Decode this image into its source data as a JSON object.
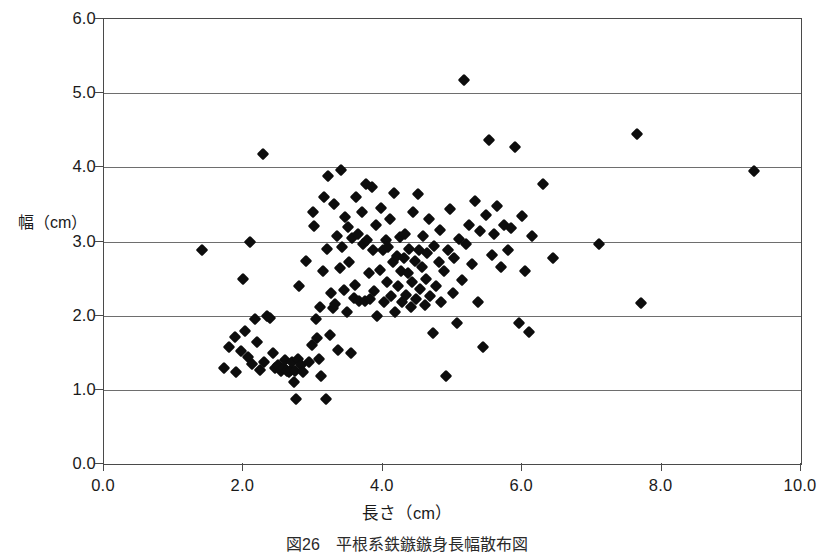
{
  "figure": {
    "caption": "図26　平根系鉄鏃鏃身長幅散布図"
  },
  "axes": {
    "y_title": "幅（cm）",
    "x_title": "長さ（cm）",
    "y_ticks": [
      "0.0",
      "1.0",
      "2.0",
      "3.0",
      "4.0",
      "5.0",
      "6.0"
    ],
    "x_ticks": [
      "0.0",
      "2.0",
      "4.0",
      "6.0",
      "8.0",
      "10.0"
    ]
  },
  "colors": {
    "marker": "#0d0d0d",
    "gridline": "#6e6e6e",
    "frame": "#4a4a4a",
    "background": "#ffffff"
  },
  "chart_data": {
    "type": "scatter",
    "title": "図26　平根系鉄鏃鏃身長幅散布図",
    "xlabel": "長さ（cm）",
    "ylabel": "幅（cm）",
    "xlim": [
      0.0,
      10.0
    ],
    "ylim": [
      0.0,
      6.0
    ],
    "xticks": [
      0.0,
      2.0,
      4.0,
      6.0,
      8.0,
      10.0
    ],
    "yticks": [
      0.0,
      1.0,
      2.0,
      3.0,
      4.0,
      5.0,
      6.0
    ],
    "grid": "horizontal",
    "legend": "none",
    "marker": "diamond",
    "n_points": 171,
    "series": [
      {
        "name": "平根系鉄鏃",
        "points": [
          [
            1.4,
            2.89
          ],
          [
            1.72,
            1.3
          ],
          [
            1.8,
            1.58
          ],
          [
            1.88,
            1.71
          ],
          [
            1.9,
            1.24
          ],
          [
            1.96,
            1.52
          ],
          [
            2.0,
            2.5
          ],
          [
            2.02,
            1.8
          ],
          [
            2.06,
            1.44
          ],
          [
            2.1,
            3.0
          ],
          [
            2.12,
            1.35
          ],
          [
            2.16,
            1.95
          ],
          [
            2.2,
            1.64
          ],
          [
            2.24,
            1.27
          ],
          [
            2.28,
            4.18
          ],
          [
            2.3,
            1.38
          ],
          [
            2.34,
            1.99
          ],
          [
            2.38,
            1.97
          ],
          [
            2.42,
            1.5
          ],
          [
            2.46,
            1.3
          ],
          [
            2.5,
            1.33
          ],
          [
            2.54,
            1.25
          ],
          [
            2.58,
            1.29
          ],
          [
            2.6,
            1.4
          ],
          [
            2.62,
            1.26
          ],
          [
            2.66,
            1.24
          ],
          [
            2.68,
            1.27
          ],
          [
            2.7,
            1.38
          ],
          [
            2.72,
            1.1
          ],
          [
            2.74,
            1.26
          ],
          [
            2.76,
            0.88
          ],
          [
            2.78,
            1.42
          ],
          [
            2.8,
            2.4
          ],
          [
            2.82,
            1.33
          ],
          [
            2.86,
            1.24
          ],
          [
            2.9,
            2.74
          ],
          [
            2.94,
            1.38
          ],
          [
            2.98,
            1.6
          ],
          [
            3.0,
            3.4
          ],
          [
            3.02,
            3.21
          ],
          [
            3.04,
            1.96
          ],
          [
            3.06,
            1.7
          ],
          [
            3.08,
            1.42
          ],
          [
            3.1,
            2.12
          ],
          [
            3.12,
            1.18
          ],
          [
            3.14,
            2.6
          ],
          [
            3.16,
            3.6
          ],
          [
            3.18,
            0.87
          ],
          [
            3.2,
            2.9
          ],
          [
            3.22,
            3.88
          ],
          [
            3.24,
            1.74
          ],
          [
            3.26,
            2.3
          ],
          [
            3.28,
            2.1
          ],
          [
            3.3,
            3.5
          ],
          [
            3.32,
            2.16
          ],
          [
            3.34,
            3.08
          ],
          [
            3.36,
            1.54
          ],
          [
            3.38,
            2.64
          ],
          [
            3.4,
            3.97
          ],
          [
            3.42,
            2.92
          ],
          [
            3.44,
            2.34
          ],
          [
            3.46,
            3.33
          ],
          [
            3.48,
            2.05
          ],
          [
            3.5,
            3.19
          ],
          [
            3.52,
            2.72
          ],
          [
            3.54,
            1.5
          ],
          [
            3.56,
            3.05
          ],
          [
            3.58,
            2.24
          ],
          [
            3.6,
            2.42
          ],
          [
            3.62,
            3.6
          ],
          [
            3.64,
            3.1
          ],
          [
            3.66,
            2.2
          ],
          [
            3.7,
            3.4
          ],
          [
            3.72,
            2.96
          ],
          [
            3.74,
            2.2
          ],
          [
            3.76,
            3.78
          ],
          [
            3.78,
            3.02
          ],
          [
            3.8,
            2.58
          ],
          [
            3.82,
            2.22
          ],
          [
            3.84,
            3.74
          ],
          [
            3.86,
            2.88
          ],
          [
            3.88,
            2.33
          ],
          [
            3.9,
            3.22
          ],
          [
            3.92,
            2.0
          ],
          [
            3.96,
            2.62
          ],
          [
            3.98,
            3.45
          ],
          [
            4.0,
            2.88
          ],
          [
            4.02,
            2.18
          ],
          [
            4.04,
            3.02
          ],
          [
            4.06,
            2.46
          ],
          [
            4.08,
            2.93
          ],
          [
            4.1,
            3.3
          ],
          [
            4.12,
            2.27
          ],
          [
            4.14,
            2.72
          ],
          [
            4.16,
            3.66
          ],
          [
            4.18,
            2.05
          ],
          [
            4.2,
            2.8
          ],
          [
            4.22,
            2.4
          ],
          [
            4.24,
            3.06
          ],
          [
            4.26,
            2.6
          ],
          [
            4.28,
            2.18
          ],
          [
            4.3,
            2.78
          ],
          [
            4.32,
            3.1
          ],
          [
            4.34,
            2.28
          ],
          [
            4.36,
            2.58
          ],
          [
            4.38,
            2.9
          ],
          [
            4.4,
            2.12
          ],
          [
            4.42,
            2.46
          ],
          [
            4.44,
            3.4
          ],
          [
            4.46,
            2.74
          ],
          [
            4.48,
            2.22
          ],
          [
            4.5,
            3.64
          ],
          [
            4.52,
            2.88
          ],
          [
            4.54,
            2.36
          ],
          [
            4.56,
            2.66
          ],
          [
            4.58,
            3.08
          ],
          [
            4.6,
            2.14
          ],
          [
            4.62,
            2.5
          ],
          [
            4.64,
            2.84
          ],
          [
            4.66,
            3.3
          ],
          [
            4.68,
            2.26
          ],
          [
            4.72,
            1.77
          ],
          [
            4.74,
            2.94
          ],
          [
            4.76,
            2.4
          ],
          [
            4.8,
            2.72
          ],
          [
            4.82,
            3.16
          ],
          [
            4.84,
            2.18
          ],
          [
            4.88,
            2.6
          ],
          [
            4.9,
            1.18
          ],
          [
            4.94,
            2.88
          ],
          [
            4.96,
            3.44
          ],
          [
            5.0,
            2.3
          ],
          [
            5.02,
            2.78
          ],
          [
            5.06,
            1.9
          ],
          [
            5.1,
            3.04
          ],
          [
            5.14,
            2.48
          ],
          [
            5.16,
            5.18
          ],
          [
            5.2,
            2.96
          ],
          [
            5.24,
            3.22
          ],
          [
            5.28,
            2.7
          ],
          [
            5.32,
            3.54
          ],
          [
            5.36,
            2.18
          ],
          [
            5.4,
            3.14
          ],
          [
            5.44,
            1.58
          ],
          [
            5.48,
            3.36
          ],
          [
            5.52,
            4.37
          ],
          [
            5.56,
            2.82
          ],
          [
            5.6,
            3.1
          ],
          [
            5.64,
            3.48
          ],
          [
            5.7,
            2.66
          ],
          [
            5.74,
            3.22
          ],
          [
            5.8,
            2.88
          ],
          [
            5.84,
            3.18
          ],
          [
            5.9,
            4.27
          ],
          [
            5.96,
            1.9
          ],
          [
            6.0,
            3.34
          ],
          [
            6.04,
            2.6
          ],
          [
            6.1,
            1.78
          ],
          [
            6.14,
            3.08
          ],
          [
            6.3,
            3.77
          ],
          [
            6.44,
            2.78
          ],
          [
            7.1,
            2.97
          ],
          [
            7.65,
            4.45
          ],
          [
            7.7,
            2.17
          ],
          [
            9.33,
            3.95
          ]
        ]
      }
    ]
  }
}
